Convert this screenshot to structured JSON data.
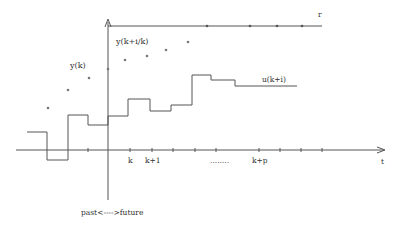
{
  "diagram": {
    "labels": {
      "reference": "r",
      "time_axis": "t",
      "measured_output": "y(k)",
      "predicted_output": "y(k+i/k)",
      "control_input": "u(k+i)",
      "tick_k": "k",
      "tick_k1": "k+1",
      "ellipsis": "........",
      "tick_kp": "k+p",
      "past_future": "past<---->future"
    },
    "colors": {
      "line": "#555555",
      "dot": "#777777",
      "text": "#333333",
      "background": "#ffffff"
    },
    "past_outputs": [
      [
        48,
        108
      ],
      [
        68,
        90
      ],
      [
        89,
        78
      ],
      [
        108,
        69
      ]
    ],
    "predicted_outputs": [
      [
        125,
        60
      ],
      [
        147,
        56
      ],
      [
        166,
        50
      ],
      [
        188,
        42
      ]
    ],
    "control_steps": [
      [
        27,
        132
      ],
      [
        47,
        132
      ],
      [
        47,
        160
      ],
      [
        68,
        160
      ],
      [
        68,
        115
      ],
      [
        88,
        115
      ],
      [
        88,
        125
      ],
      [
        108,
        125
      ],
      [
        108,
        116
      ],
      [
        128,
        116
      ],
      [
        128,
        99
      ],
      [
        150,
        99
      ],
      [
        150,
        111
      ],
      [
        171,
        111
      ],
      [
        171,
        105
      ],
      [
        192,
        105
      ],
      [
        192,
        75
      ],
      [
        211,
        75
      ],
      [
        211,
        80
      ],
      [
        235,
        80
      ],
      [
        235,
        86
      ],
      [
        297,
        86
      ]
    ],
    "time_ticks": [
      88,
      108,
      130,
      152,
      173,
      195,
      216,
      259,
      280,
      301,
      322
    ],
    "reference_ticks": [
      207,
      250,
      277,
      302
    ]
  }
}
